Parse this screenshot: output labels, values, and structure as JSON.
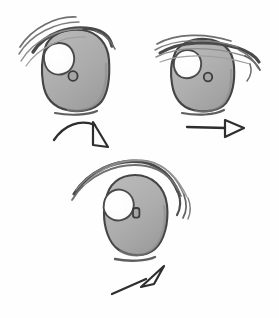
{
  "page": {
    "background_color": "#fefefe",
    "width": 279,
    "height": 318,
    "medium": "pencil sketch on paper"
  },
  "palette": {
    "iris_fill": "#a9a9a9",
    "iris_fill_light": "#b8b8b8",
    "iris_shadow": "#8f8f8f",
    "outline_dark": "#3a3a3a",
    "outline_mid": "#5a5a5a",
    "lash_light": "#9a9a9a",
    "highlight_white": "#fdfdfd",
    "arrow_color": "#2e2e2e",
    "paper": "#fefefe"
  },
  "drawing": {
    "figures": [
      {
        "id": "eye-top-left",
        "name": "eye-top-left",
        "label": "Eye 1 — rounded square iris, heavy upper lashes sweeping left",
        "center_x": 74,
        "center_y": 72,
        "iris_shape": "rounded-square",
        "iris_width": 66,
        "iris_height": 72,
        "highlight": {
          "cx": 56,
          "cy": 55,
          "r": 14,
          "shape": "circle"
        },
        "pupil_mark": {
          "cx": 73,
          "cy": 76,
          "rx": 4.5,
          "ry": 4.5,
          "shape": "ring"
        },
        "lash_count": 4,
        "lash_direction": "sweeps up and to the left",
        "lower_lid_line": true
      },
      {
        "id": "eye-top-right",
        "name": "eye-top-right",
        "label": "Eye 2 — flatter horizontal lid line, lashes extend right",
        "center_x": 203,
        "center_y": 75,
        "iris_shape": "rounded-square",
        "iris_width": 62,
        "iris_height": 66,
        "highlight": {
          "cx": 190,
          "cy": 62,
          "r": 12,
          "shape": "circle"
        },
        "pupil_mark": {
          "cx": 208,
          "cy": 77,
          "rx": 4,
          "ry": 4,
          "shape": "ring"
        },
        "lash_count": 4,
        "lash_direction": "nearly horizontal, tapering past the right corner",
        "lower_lid_line": true
      },
      {
        "id": "eye-bottom-center",
        "name": "eye-bottom-center",
        "label": "Eye 3 — tall oval iris, dramatic arcing lash curling down at right",
        "center_x": 135,
        "center_y": 217,
        "iris_shape": "oval",
        "iris_width": 62,
        "iris_height": 76,
        "highlight": {
          "cx": 117,
          "cy": 200,
          "r": 13,
          "shape": "circle"
        },
        "pupil_mark": {
          "cx": 136,
          "cy": 213,
          "rx": 3,
          "ry": 4.5,
          "shape": "ring"
        },
        "lash_count": 3,
        "lash_direction": "high sweeping arc that curls downward into points on the right",
        "lower_lid_line": true
      }
    ],
    "arrows": [
      {
        "id": "arrow-curved-down-right",
        "name": "arrow-curved-down-right",
        "label": "Curved arrow from eye 1 pointing down-right",
        "style": "curved",
        "head": "open-triangle",
        "from_x": 55,
        "from_y": 139,
        "to_x": 107,
        "to_y": 145,
        "direction": "down-right"
      },
      {
        "id": "arrow-straight-right",
        "name": "arrow-straight-right",
        "label": "Straight horizontal arrow below eye 2 pointing right",
        "style": "straight",
        "head": "open-triangle",
        "from_x": 188,
        "from_y": 127,
        "to_x": 243,
        "to_y": 128,
        "direction": "right"
      },
      {
        "id": "arrow-diagonal-up-right",
        "name": "arrow-diagonal-up-right",
        "label": "Diagonal arrow below eye 3 pointing up-right",
        "style": "straight",
        "head": "open-triangle",
        "from_x": 113,
        "from_y": 293,
        "to_x": 163,
        "to_y": 268,
        "direction": "up-right"
      }
    ]
  }
}
